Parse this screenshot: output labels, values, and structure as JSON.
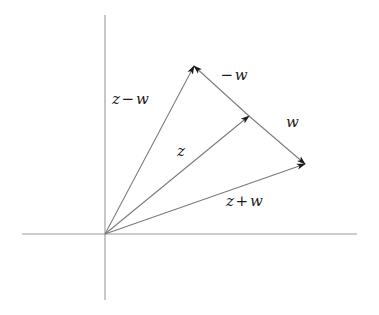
{
  "figure": {
    "background_color": "#ffffff",
    "line_color": "#7a7a7a",
    "axis_color": "#9a9a9a",
    "label_color": "#1b1b1b"
  },
  "axes": {
    "origin": {
      "x": 105,
      "y": 234
    },
    "horizontal": {
      "x1": 22,
      "y1": 234,
      "x2": 357,
      "y2": 234
    },
    "vertical": {
      "x1": 105,
      "y1": 15,
      "x2": 105,
      "y2": 300
    }
  },
  "points": {
    "origin": {
      "x": 105,
      "y": 234
    },
    "z_minus_w_tip": {
      "x": 194,
      "y": 66
    },
    "z_tip": {
      "x": 249,
      "y": 116
    },
    "z_plus_w_tip": {
      "x": 305,
      "y": 164
    }
  },
  "vectors": [
    {
      "name": "z-minus-w",
      "label": "z − w",
      "label_parts": {
        "first": "z",
        "op": "−",
        "second": "w"
      },
      "from": "origin",
      "to": "z_minus_w_tip",
      "arrow": "end"
    },
    {
      "name": "z",
      "label": "z",
      "label_parts": {
        "first": "z",
        "op": "",
        "second": ""
      },
      "from": "origin",
      "to": "z_tip",
      "arrow": "end"
    },
    {
      "name": "z-plus-w",
      "label": "z + w",
      "label_parts": {
        "first": "z",
        "op": "+",
        "second": "w"
      },
      "from": "origin",
      "to": "z_plus_w_tip",
      "arrow": "end"
    },
    {
      "name": "minus-w",
      "label": "−w",
      "label_parts": {
        "first": "",
        "op": "−",
        "second": "w"
      },
      "from": "z_tip",
      "to": "z_minus_w_tip",
      "arrow": "end"
    },
    {
      "name": "w",
      "label": "w",
      "label_parts": {
        "first": "",
        "op": "",
        "second": "w"
      },
      "from": "z_tip",
      "to": "z_plus_w_tip",
      "arrow": "end"
    }
  ],
  "labels": {
    "z_minus_w": {
      "text_first": "z",
      "text_op": "−",
      "text_second": "w",
      "x": 112,
      "y": 90
    },
    "minus_w": {
      "text_first": "",
      "text_op": "−",
      "text_second": "w",
      "x": 219,
      "y": 66
    },
    "w": {
      "text_first": "",
      "text_op": "",
      "text_second": "w",
      "x": 283,
      "y": 113
    },
    "z": {
      "text_first": "",
      "text_op": "",
      "text_second": "z",
      "x": 174,
      "y": 142
    },
    "z_plus_w": {
      "text_first": "z",
      "text_op": "+",
      "text_second": "w",
      "x": 226,
      "y": 192
    }
  }
}
